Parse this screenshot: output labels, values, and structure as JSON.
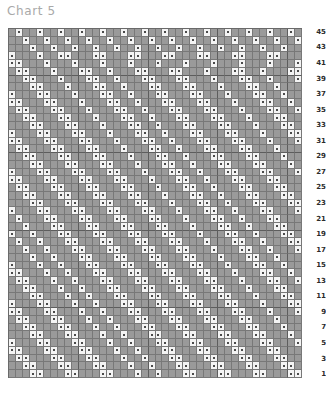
{
  "title": "Chart 5",
  "chart_data": {
    "type": "table",
    "title": "Chart 5",
    "xlabel": "",
    "ylabel": "",
    "columns": 42,
    "rows": 45,
    "symbols": {
      "blank": "gray empty square",
      "dot": "white square with centre dot"
    },
    "legend": [
      {
        "swatch": "#9a9a9a",
        "label": "blank cell"
      },
      {
        "swatch": "#f4f4f4",
        "label": "dot cell"
      }
    ],
    "colors": {
      "cell_blank": "#9a9a9a",
      "cell_on": "#f4f4f4",
      "grid_line": "#787878",
      "grid_major": "#5d5d5d",
      "dot": "#4a4a4a",
      "title": "#a9a9a9",
      "row_label": "#2b2b2b",
      "page": "#ffffff"
    },
    "row_labels_side": "right",
    "row_labels": [
      45,
      43,
      41,
      39,
      37,
      35,
      33,
      31,
      29,
      27,
      25,
      23,
      21,
      19,
      17,
      15,
      13,
      11,
      9,
      7,
      5,
      3,
      1
    ],
    "row_label_note": "odd rows only, numbered 1 at bottom to 45 at top",
    "grid": [
      "010010010010010010010010010010010010010010",
      "001001001001001001001001001001001001001001",
      "000100100100100100100100100100100100100100",
      "100010011000110001100011000110001100011000",
      "110001000100010001000100010001000100010001",
      "011000100011001000110001100010001100100011",
      "001100010001100100011000110001000110010001",
      "000110001000110010001100011000100011001000",
      "100011000100011001000110001100010001100100",
      "110001100010001100100011000110001000110010",
      "011000110001000110010001100011000100011001",
      "001100011000100011001000110001100010001100",
      "000110001100010001100100011000110001000110",
      "100011000110001000110010001100011000100011",
      "110001100011000100011001000110001100010001",
      "011000110001100010001100100011000110001000",
      "001100011000110001000110010001100011000100",
      "000110001100011000100011001000110001100010",
      "100011000110001100010001100100011000110001",
      "110001100011000110001000110010001100011000",
      "011000110001100011000100011001000110001100",
      "001100011000110001100010001100100011000110",
      "000110001100011000110001000110010001100011",
      "100011000110001100011000100011001000110001",
      "010001100011000110001100010001100100011000",
      "001000110001100011000110001000110010001100",
      "100100011000110001100011000100011001000110",
      "010010001100011000110001100010001100100011",
      "001001000110001100011000110001000110010001",
      "000100100011000110001100011000100011001000",
      "100010010001100011000110001100010001100100",
      "110001001000110001100011000110001000110010",
      "011000100100011000110001100011000100011001",
      "001100010010001100011000110001100010001100",
      "000110001001000110001100011000110001000110",
      "100011000100100011000110001100011000100011",
      "110001100010010001100011000110001100010001",
      "011000110001001000110001100011000110001000",
      "001100011000100100011000110001100011000100",
      "000110001100010010001100011000110001100010",
      "100011000110001001000110001100011000110001",
      "110001100011000100100011000110001100011000",
      "011000110001100010010001100011000110001100",
      "001100011000110001001000110001100011000110",
      "000110001100011000100100011000110001100011"
    ]
  }
}
